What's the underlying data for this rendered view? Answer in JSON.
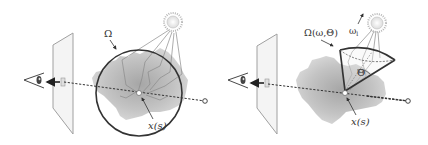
{
  "figure": {
    "panels": [
      {
        "id": "left",
        "labels": {
          "omega": "Ω",
          "point": "x(s)"
        },
        "elements": [
          "eye",
          "image-plane",
          "pixel",
          "camera-ray",
          "participating-medium",
          "sphere-Omega",
          "light-source",
          "light-paths",
          "sample-point",
          "ray-origin"
        ]
      },
      {
        "id": "right",
        "labels": {
          "omega": "Ω(ω,Θ)",
          "light_dir": "ωl",
          "light_dir_main": "ω",
          "light_dir_sub": "l",
          "angle": "Θ",
          "point": "x(s)"
        },
        "elements": [
          "eye",
          "image-plane",
          "pixel",
          "camera-ray",
          "participating-medium",
          "cone-Omega",
          "light-source",
          "light-paths",
          "sample-point",
          "ray-origin"
        ]
      }
    ],
    "colors": {
      "outline": "#333333",
      "plane_fill": "#f2f2f2",
      "plane_stroke": "#9a9a9a",
      "medium_dark": "#a8a8a8",
      "medium_light": "#d6d6d6",
      "sun_fill": "#eeeeee",
      "sun_rays": "#aaaaaa",
      "path_stroke": "#8a8a8a"
    }
  }
}
